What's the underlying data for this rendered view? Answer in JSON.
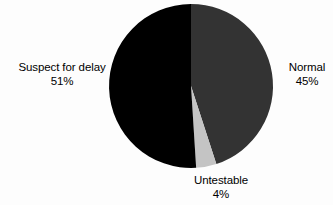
{
  "chart_data": {
    "type": "pie",
    "title": "",
    "subtitle": "",
    "xlabel": "",
    "ylabel": "",
    "legend_position": "none",
    "grid": false,
    "categories": [
      "Normal",
      "Untestable",
      "Suspect for delay"
    ],
    "values": [
      45,
      4,
      51
    ],
    "unit": "%",
    "start_angle_deg": 0,
    "direction": "clockwise",
    "slices": [
      {
        "label": "Normal",
        "value": 45,
        "value_text": "45%",
        "color": "#333333",
        "start_deg": 0,
        "end_deg": 162,
        "label_position": "right"
      },
      {
        "label": "Untestable",
        "value": 4,
        "value_text": "4%",
        "color": "#c4c4c4",
        "start_deg": 162,
        "end_deg": 176.4,
        "label_position": "bottom"
      },
      {
        "label": "Suspect for delay",
        "value": 51,
        "value_text": "51%",
        "color": "#000000",
        "start_deg": 176.4,
        "end_deg": 360,
        "label_position": "left"
      }
    ],
    "geometry": {
      "center_x": 191,
      "center_y": 86,
      "radius": 82
    }
  },
  "labels": {
    "suspect": {
      "name": "Suspect for delay",
      "value": "51%"
    },
    "normal": {
      "name": "Normal",
      "value": "45%"
    },
    "untestable": {
      "name": "Untestable",
      "value": "4%"
    }
  },
  "colors": {
    "background": "#fdfdfd",
    "normal": "#333333",
    "untestable": "#c4c4c4",
    "suspect": "#000000",
    "text": "#000000"
  }
}
